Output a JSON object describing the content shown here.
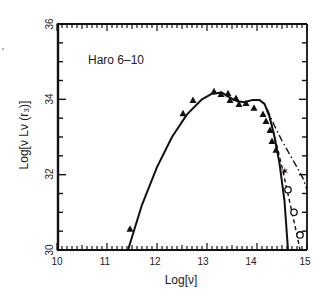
{
  "chart_data": {
    "type": "scatter",
    "title": "",
    "annotation": "Haro 6–10",
    "xlabel": "Log[ν]",
    "ylabel": "Log[ν Lν (r₃)]",
    "xlim": [
      10,
      15
    ],
    "ylim": [
      30,
      36
    ],
    "xticks": [
      10,
      11,
      12,
      13,
      14,
      15
    ],
    "yticks": [
      30,
      32,
      34,
      36
    ],
    "grid": false,
    "legend": null,
    "series": [
      {
        "name": "observed (filled triangles)",
        "marker": "triangle-filled",
        "points": [
          [
            11.46,
            30.55
          ],
          [
            12.52,
            33.62
          ],
          [
            12.72,
            33.97
          ],
          [
            13.14,
            34.2
          ],
          [
            13.28,
            34.13
          ],
          [
            13.42,
            34.15
          ],
          [
            13.46,
            33.97
          ],
          [
            13.58,
            34.02
          ],
          [
            13.64,
            33.86
          ],
          [
            13.78,
            33.89
          ],
          [
            13.94,
            33.76
          ],
          [
            14.12,
            33.6
          ],
          [
            14.18,
            33.41
          ],
          [
            14.26,
            33.17
          ],
          [
            14.3,
            32.88
          ],
          [
            14.38,
            32.65
          ]
        ]
      },
      {
        "name": "observed (star)",
        "marker": "star",
        "points": [
          [
            14.54,
            32.1
          ]
        ]
      },
      {
        "name": "observed (open circles)",
        "marker": "circle-open",
        "points": [
          [
            14.62,
            31.6
          ],
          [
            14.74,
            31.0
          ],
          [
            14.86,
            30.4
          ]
        ]
      },
      {
        "name": "model (solid)",
        "line": "solid",
        "points": [
          [
            11.42,
            30.0
          ],
          [
            11.7,
            31.2
          ],
          [
            12.0,
            32.2
          ],
          [
            12.3,
            33.0
          ],
          [
            12.6,
            33.6
          ],
          [
            12.9,
            34.0
          ],
          [
            13.1,
            34.15
          ],
          [
            13.3,
            34.18
          ],
          [
            13.45,
            34.05
          ],
          [
            13.6,
            33.95
          ],
          [
            13.75,
            33.92
          ],
          [
            13.9,
            33.98
          ],
          [
            14.05,
            33.98
          ],
          [
            14.15,
            33.88
          ],
          [
            14.25,
            33.55
          ],
          [
            14.35,
            33.0
          ],
          [
            14.45,
            32.3
          ],
          [
            14.55,
            31.3
          ],
          [
            14.62,
            30.0
          ]
        ]
      },
      {
        "name": "model (dashed)",
        "line": "dashed",
        "points": [
          [
            14.2,
            33.7
          ],
          [
            14.3,
            33.3
          ],
          [
            14.4,
            32.75
          ],
          [
            14.5,
            32.2
          ],
          [
            14.6,
            31.6
          ],
          [
            14.7,
            31.0
          ],
          [
            14.8,
            30.4
          ],
          [
            14.86,
            30.0
          ]
        ]
      },
      {
        "name": "model (dash-dot)",
        "line": "dash-dot",
        "points": [
          [
            14.2,
            33.75
          ],
          [
            14.35,
            33.3
          ],
          [
            14.5,
            32.9
          ],
          [
            14.65,
            32.55
          ],
          [
            14.8,
            32.2
          ],
          [
            14.92,
            31.9
          ],
          [
            15.0,
            31.6
          ]
        ]
      }
    ]
  },
  "labels": {
    "annotation": "Haro 6–10",
    "xlabel": "Log[ν]",
    "ylabel": "Log[ν Lν (r₃)]",
    "xtick_10": "10",
    "xtick_11": "11",
    "xtick_12": "12",
    "xtick_13": "13",
    "xtick_14": "14",
    "xtick_15": "15",
    "ytick_30": "30",
    "ytick_32": "32",
    "ytick_34": "34",
    "ytick_36": "36"
  },
  "colors": {
    "ink": "#111111",
    "background": "#ffffff"
  }
}
